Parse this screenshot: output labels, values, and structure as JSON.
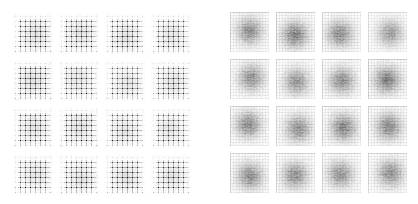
{
  "figure": {
    "panels": [
      {
        "id": "left",
        "description": "4x4 grid of generated samples with strong checkerboard artifacts",
        "pattern": "checkerboard",
        "rows": 4,
        "cols": 4,
        "tiles": [
          {
            "seed": 11,
            "darkness": 0.8
          },
          {
            "seed": 12,
            "darkness": 0.75
          },
          {
            "seed": 13,
            "darkness": 0.78
          },
          {
            "seed": 14,
            "darkness": 0.72
          },
          {
            "seed": 21,
            "darkness": 0.85
          },
          {
            "seed": 22,
            "darkness": 0.7
          },
          {
            "seed": 23,
            "darkness": 0.68
          },
          {
            "seed": 24,
            "darkness": 0.74
          },
          {
            "seed": 31,
            "darkness": 0.76
          },
          {
            "seed": 32,
            "darkness": 0.8
          },
          {
            "seed": 33,
            "darkness": 0.72
          },
          {
            "seed": 34,
            "darkness": 0.7
          },
          {
            "seed": 41,
            "darkness": 0.74
          },
          {
            "seed": 42,
            "darkness": 0.76
          },
          {
            "seed": 43,
            "darkness": 0.78
          },
          {
            "seed": 44,
            "darkness": 0.75
          }
        ]
      },
      {
        "id": "right",
        "description": "4x4 grid of generated samples with diffuse central blobs and faint grid",
        "pattern": "blob",
        "rows": 4,
        "cols": 4,
        "tiles": [
          {
            "seed": 51,
            "darkness": 0.7
          },
          {
            "seed": 52,
            "darkness": 0.78
          },
          {
            "seed": 53,
            "darkness": 0.72
          },
          {
            "seed": 54,
            "darkness": 0.6
          },
          {
            "seed": 61,
            "darkness": 0.68
          },
          {
            "seed": 62,
            "darkness": 0.66
          },
          {
            "seed": 63,
            "darkness": 0.7
          },
          {
            "seed": 64,
            "darkness": 0.8
          },
          {
            "seed": 71,
            "darkness": 0.72
          },
          {
            "seed": 72,
            "darkness": 0.7
          },
          {
            "seed": 73,
            "darkness": 0.76
          },
          {
            "seed": 74,
            "darkness": 0.74
          },
          {
            "seed": 81,
            "darkness": 0.72
          },
          {
            "seed": 82,
            "darkness": 0.7
          },
          {
            "seed": 83,
            "darkness": 0.68
          },
          {
            "seed": 84,
            "darkness": 0.7
          }
        ]
      }
    ],
    "colors": {
      "background": "#ffffff",
      "ink": "#1a1a1a"
    }
  }
}
